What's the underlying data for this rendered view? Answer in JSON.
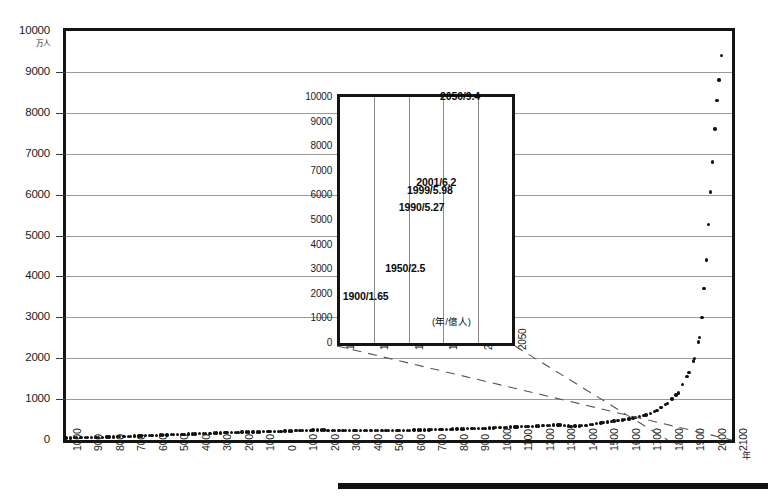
{
  "chart_data": {
    "type": "line",
    "title": "",
    "subtitle": "",
    "xlabel": "年",
    "ylabel": "万人",
    "y_unit_note": "万人",
    "x_unit_note": "年",
    "grid": true,
    "legend": "none",
    "note": "World population from 1000 BC to 2100 AD, dotted series; inset magnifies 1800-2050",
    "main": {
      "xlim": [
        -1000,
        2100
      ],
      "ylim": [
        0,
        10000
      ],
      "y_ticks": [
        0,
        1000,
        2000,
        3000,
        4000,
        5000,
        6000,
        7000,
        8000,
        9000,
        10000
      ],
      "y_tick_labels": [
        "0",
        "1000",
        "2000",
        "3000",
        "4000",
        "5000",
        "6000",
        "7000",
        "8000",
        "9000",
        "10000"
      ],
      "x_ticks": [
        -1000,
        -900,
        -800,
        -700,
        -600,
        -500,
        -400,
        -300,
        -200,
        -100,
        0,
        100,
        200,
        300,
        400,
        500,
        600,
        700,
        800,
        900,
        1000,
        1100,
        1200,
        1300,
        1400,
        1500,
        1600,
        1700,
        1800,
        1900,
        2000,
        2100
      ],
      "x_tick_labels": [
        "1000",
        "900",
        "800",
        "700",
        "600",
        "500",
        "400",
        "300",
        "200",
        "100",
        "0",
        "100",
        "200",
        "300",
        "400",
        "500",
        "600",
        "700",
        "800",
        "900",
        "1000",
        "1100",
        "1200",
        "1300",
        "1400",
        "1500",
        "1600",
        "1700",
        "1800",
        "1900",
        "2000",
        "2100"
      ],
      "x": [
        -1000,
        -950,
        -900,
        -850,
        -800,
        -750,
        -700,
        -650,
        -600,
        -550,
        -500,
        -450,
        -400,
        -350,
        -300,
        -250,
        -200,
        -150,
        -100,
        -50,
        0,
        50,
        100,
        150,
        200,
        250,
        300,
        350,
        400,
        450,
        500,
        550,
        600,
        650,
        700,
        750,
        800,
        850,
        900,
        950,
        1000,
        1050,
        1100,
        1150,
        1200,
        1250,
        1300,
        1350,
        1400,
        1450,
        1500,
        1550,
        1600,
        1650,
        1700,
        1750,
        1800,
        1850,
        1900,
        1925,
        1950,
        1960,
        1970,
        1980,
        1990,
        2000,
        2010,
        2020,
        2030,
        2040,
        2050
      ],
      "y": [
        50,
        55,
        60,
        65,
        72,
        80,
        90,
        100,
        110,
        120,
        130,
        140,
        150,
        160,
        170,
        180,
        190,
        195,
        200,
        205,
        215,
        225,
        235,
        240,
        240,
        235,
        230,
        228,
        226,
        226,
        228,
        232,
        238,
        244,
        250,
        258,
        265,
        272,
        280,
        288,
        300,
        310,
        320,
        330,
        345,
        360,
        370,
        330,
        350,
        380,
        425,
        460,
        500,
        545,
        610,
        720,
        900,
        1150,
        1650,
        2000,
        2500,
        3000,
        3700,
        4400,
        5270,
        6060,
        6800,
        7600,
        8300,
        8800,
        9400
      ]
    },
    "inset": {
      "xlim": [
        1800,
        2050
      ],
      "ylim": [
        0,
        10000
      ],
      "y_ticks": [
        0,
        1000,
        2000,
        3000,
        4000,
        5000,
        6000,
        7000,
        8000,
        9000,
        10000
      ],
      "y_tick_labels": [
        "0",
        "1000",
        "2000",
        "3000",
        "4000",
        "5000",
        "6000",
        "7000",
        "8000",
        "9000",
        "10000"
      ],
      "x_ticks": [
        1800,
        1850,
        1900,
        1950,
        2000,
        2050
      ],
      "x_tick_labels": [
        "1800",
        "1850",
        "1900",
        "1950",
        "2000",
        "2050"
      ],
      "unit_note": "(年/億人)",
      "x": [
        1800,
        1810,
        1820,
        1830,
        1840,
        1850,
        1860,
        1870,
        1880,
        1890,
        1900,
        1910,
        1920,
        1930,
        1940,
        1950,
        1960,
        1965,
        1970,
        1975,
        1980,
        1985,
        1990,
        1995,
        1999,
        2001,
        2005,
        2010,
        2015,
        2020,
        2025,
        2030,
        2035,
        2040,
        2045,
        2050
      ],
      "y": [
        980,
        1020,
        1070,
        1120,
        1180,
        1250,
        1300,
        1350,
        1420,
        1530,
        1650,
        1760,
        1860,
        2070,
        2300,
        2500,
        3020,
        3330,
        3700,
        4070,
        4450,
        4850,
        5270,
        5700,
        5980,
        6200,
        6500,
        6900,
        7350,
        7750,
        8150,
        8500,
        8800,
        9050,
        9250,
        9400
      ],
      "annotations": [
        {
          "label": "2050/9.4",
          "year": 2050,
          "value": 9.4
        },
        {
          "label": "2001/6.2",
          "year": 2001,
          "value": 6.2
        },
        {
          "label": "1999/5.98",
          "year": 1999,
          "value": 5.98
        },
        {
          "label": "1990/5.27",
          "year": 1990,
          "value": 5.27
        },
        {
          "label": "1950/2.5",
          "year": 1950,
          "value": 2.5
        },
        {
          "label": "1900/1.65",
          "year": 1900,
          "value": 1.65
        }
      ]
    }
  },
  "colors": {
    "frame": "#141414",
    "grid": "#9a9a9a",
    "dot": "#101010",
    "leader": "#555555",
    "bar": "#111111",
    "background": "#ffffff"
  }
}
